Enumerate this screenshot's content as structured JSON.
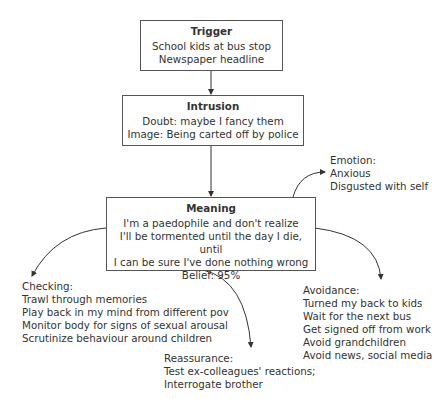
{
  "diagram": {
    "trigger": {
      "title": "Trigger",
      "lines": [
        "School kids at bus stop",
        "Newspaper headline"
      ]
    },
    "intrusion": {
      "title": "Intrusion",
      "lines": [
        "Doubt: maybe I fancy them",
        "Image: Being carted off by police"
      ]
    },
    "meaning": {
      "title": "Meaning",
      "lines": [
        "I'm a paedophile and don't realize",
        "I'll be tormented until the day I die, until",
        "I can be sure I've done nothing wrong",
        "Belief: 95%"
      ]
    },
    "emotion": {
      "title": "Emotion:",
      "lines": [
        "Anxious",
        "Disgusted with self"
      ]
    },
    "checking": {
      "title": "Checking:",
      "lines": [
        "Trawl through memories",
        "Play back in my mind from different pov",
        "Monitor body for signs of sexual arousal",
        "Scrutinize behaviour around children"
      ]
    },
    "reassurance": {
      "title": "Reassurance:",
      "lines": [
        "Test ex-colleagues' reactions;",
        "Interrogate brother"
      ]
    },
    "avoidance": {
      "title": "Avoidance:",
      "lines": [
        "Turned my back to kids",
        "Wait for the next bus",
        "Get signed off from work",
        "Avoid grandchildren",
        "Avoid news, social media"
      ]
    }
  }
}
